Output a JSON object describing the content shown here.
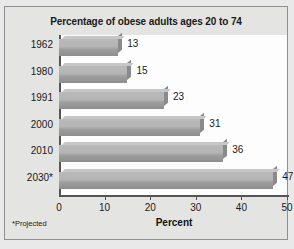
{
  "chart_data": {
    "type": "bar",
    "orientation": "horizontal",
    "title": "Percentage of obese adults ages 20 to 74",
    "categories": [
      "1962",
      "1980",
      "1991",
      "2000",
      "2010",
      "2030*"
    ],
    "values": [
      13,
      15,
      23,
      31,
      36,
      47
    ],
    "xlabel": "Percent",
    "ylabel": "",
    "xlim": [
      0,
      50
    ],
    "xticks": [
      0,
      10,
      20,
      30,
      40,
      50
    ],
    "xticklabels": [
      "0",
      "10",
      "20",
      "30",
      "40",
      "50"
    ],
    "grid": false,
    "legend": false,
    "footnote": "*Projected",
    "bar_color": "#b4b4b4",
    "bar_shadow_color": "#8a8a8a",
    "axis_color": "#555555",
    "panel_color": "#e4e4e2",
    "plot_color": "#fdfdfd"
  }
}
